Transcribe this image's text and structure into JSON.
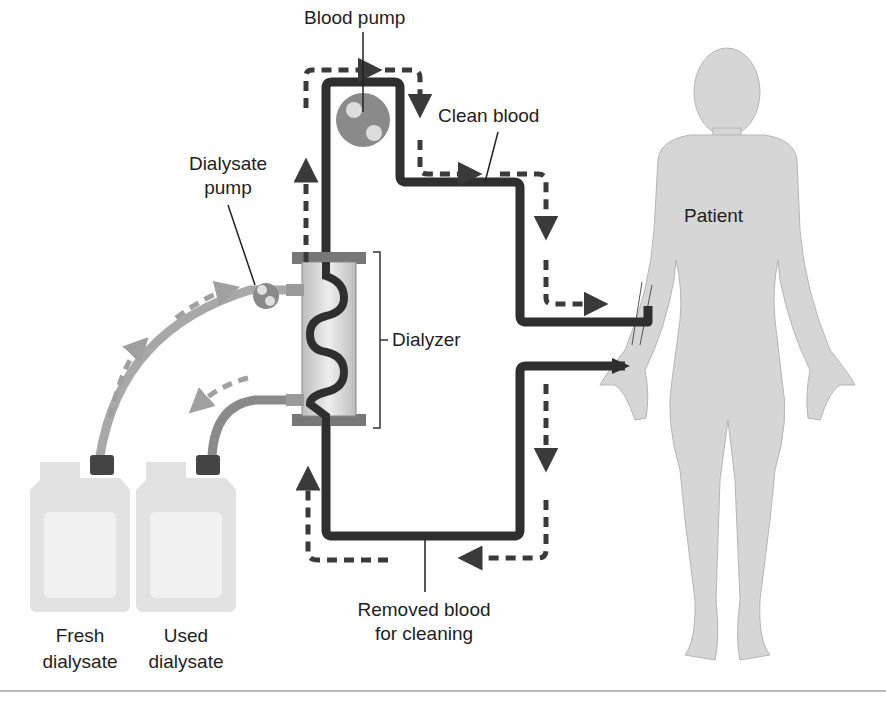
{
  "diagram": {
    "type": "hemodialysis-circuit",
    "labels": {
      "blood_pump": "Blood pump",
      "clean_blood": "Clean blood",
      "dialysate_pump_line1": "Dialysate",
      "dialysate_pump_line2": "pump",
      "dialyzer": "Dialyzer",
      "patient": "Patient",
      "removed_blood_line1": "Removed blood",
      "removed_blood_line2": "for cleaning",
      "fresh_line1": "Fresh",
      "fresh_line2": "dialysate",
      "used_line1": "Used",
      "used_line2": "dialysate"
    },
    "colors": {
      "blood_tube": "#2f2f2f",
      "flow_arrow": "#3a3a3a",
      "pump": "#8a8a8a",
      "dialysate_tube": "#a8a8a8",
      "body": "#d6d6d6",
      "container": "#e2e2e2",
      "cap": "#444444"
    }
  }
}
